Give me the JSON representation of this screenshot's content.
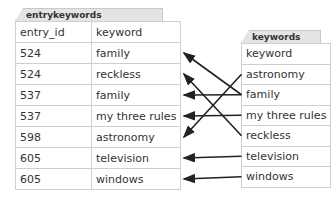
{
  "entrykeywords": {
    "title": "entrykeywords",
    "headers": [
      "entry_id",
      "keyword"
    ],
    "rows": [
      [
        "524",
        "family"
      ],
      [
        "524",
        "reckless"
      ],
      [
        "537",
        "family"
      ],
      [
        "537",
        "my three rules"
      ],
      [
        "598",
        "astronomy"
      ],
      [
        "605",
        "television"
      ],
      [
        "605",
        "windows"
      ]
    ]
  },
  "keywords": {
    "title": "keywords",
    "header": "keyword",
    "rows": [
      "astronomy",
      "family",
      "my three rules",
      "reckless",
      "television",
      "windows"
    ]
  },
  "links": [
    {
      "from": "family",
      "to_row": 0
    },
    {
      "from": "reckless",
      "to_row": 1
    },
    {
      "from": "family",
      "to_row": 2
    },
    {
      "from": "my three rules",
      "to_row": 3
    },
    {
      "from": "astronomy",
      "to_row": 4
    },
    {
      "from": "television",
      "to_row": 5
    },
    {
      "from": "windows",
      "to_row": 6
    }
  ]
}
